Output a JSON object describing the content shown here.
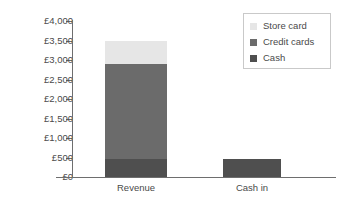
{
  "chart_data": {
    "type": "bar",
    "stacked": true,
    "title": "",
    "xlabel": "",
    "ylabel": "",
    "categories": [
      "Revenue",
      "Cash in"
    ],
    "series": [
      {
        "name": "Cash",
        "values": [
          450,
          450
        ],
        "color": "#4f4f4f"
      },
      {
        "name": "Credit cards",
        "values": [
          2450,
          0
        ],
        "color": "#6b6b6b"
      },
      {
        "name": "Store card",
        "values": [
          600,
          0
        ],
        "color": "#e6e6e6"
      }
    ],
    "stack_tops": {
      "Revenue": {
        "cash": 450,
        "credit_cards": 2900,
        "store_card": 3500
      },
      "Cash in": {
        "cash": 450
      }
    },
    "ylim": [
      0,
      4000
    ],
    "ytick_values": [
      0,
      500,
      1000,
      1500,
      2000,
      2500,
      3000,
      3500,
      4000
    ],
    "ytick_labels": [
      "£0",
      "£500",
      "£1,000",
      "£1,500",
      "£2,000",
      "£2,500",
      "£3,000",
      "£3,500",
      "£4,000"
    ],
    "grid": false,
    "legend_position": "top-right",
    "legend_entries": [
      "Store card",
      "Credit cards",
      "Cash"
    ]
  },
  "axis": {
    "ticks": [
      {
        "label": "£4,000",
        "value": 4000
      },
      {
        "label": "£3,500",
        "value": 3500
      },
      {
        "label": "£3,000",
        "value": 3000
      },
      {
        "label": "£2,500",
        "value": 2500
      },
      {
        "label": "£2,000",
        "value": 2000
      },
      {
        "label": "£1,500",
        "value": 1500
      },
      {
        "label": "£1,000",
        "value": 1000
      },
      {
        "label": "£500",
        "value": 500
      },
      {
        "label": "£0",
        "value": 0
      }
    ]
  },
  "bars": [
    {
      "category": "Revenue",
      "segments": [
        {
          "name": "store-card",
          "label": "Store card",
          "from": 2900,
          "to": 3500,
          "color": "#e6e6e6"
        },
        {
          "name": "credit-cards",
          "label": "Credit cards",
          "from": 450,
          "to": 2900,
          "color": "#6b6b6b"
        },
        {
          "name": "cash",
          "label": "Cash",
          "from": 0,
          "to": 450,
          "color": "#4f4f4f"
        }
      ]
    },
    {
      "category": "Cash in",
      "segments": [
        {
          "name": "cash",
          "label": "Cash",
          "from": 0,
          "to": 450,
          "color": "#4f4f4f"
        }
      ]
    }
  ],
  "legend": {
    "items": [
      {
        "label": "Store card",
        "color": "#e6e6e6"
      },
      {
        "label": "Credit cards",
        "color": "#6b6b6b"
      },
      {
        "label": "Cash",
        "color": "#4f4f4f"
      }
    ]
  },
  "colors": {
    "axis": "#6e6e6e",
    "text": "#4a4a4a",
    "legend_border": "#c9c9c9",
    "background": "#ffffff"
  }
}
